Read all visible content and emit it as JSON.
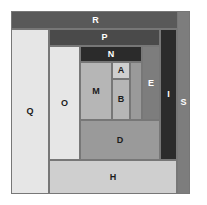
{
  "figure": {
    "canvas": {
      "width": 207,
      "height": 205
    },
    "background_color": "#ffffff",
    "frame": {
      "x": 11,
      "y": 11,
      "width": 179,
      "height": 183,
      "border_color": "#6e6e6e",
      "fill_color": "#b8b8b8"
    },
    "palette": {
      "near_black": "#2b2b2b",
      "dark_gray": "#4a4a4a",
      "medium_dark_gray": "#595959",
      "medium_gray": "#7d7d7d",
      "mid_light_gray": "#9a9a9a",
      "light_gray": "#b6b6b6",
      "pale_gray": "#cfcfcf",
      "near_white": "#e6e6e6",
      "outline": "#777777",
      "label_dark": "#1c1c1c",
      "label_light": "#ffffff"
    },
    "pieces": [
      {
        "id": "R",
        "label": "R",
        "x": 11,
        "y": 11,
        "width": 169,
        "height": 18,
        "fill": "#595959",
        "label_color": "light"
      },
      {
        "id": "Q",
        "label": "Q",
        "x": 11,
        "y": 29,
        "width": 38,
        "height": 165,
        "fill": "#e6e6e6",
        "label_color": "dark"
      },
      {
        "id": "P",
        "label": "P",
        "x": 49,
        "y": 29,
        "width": 111,
        "height": 17,
        "fill": "#4a4a4a",
        "label_color": "light"
      },
      {
        "id": "O",
        "label": "O",
        "x": 49,
        "y": 46,
        "width": 31,
        "height": 114,
        "fill": "#e6e6e6",
        "label_color": "dark"
      },
      {
        "id": "N",
        "label": "N",
        "x": 80,
        "y": 46,
        "width": 62,
        "height": 16,
        "fill": "#2b2b2b",
        "label_color": "light"
      },
      {
        "id": "E",
        "label": "E",
        "x": 142,
        "y": 46,
        "width": 18,
        "height": 74,
        "fill": "#7d7d7d",
        "label_color": "light"
      },
      {
        "id": "I",
        "label": "I",
        "x": 160,
        "y": 29,
        "width": 17,
        "height": 131,
        "fill": "#2b2b2b",
        "label_color": "light"
      },
      {
        "id": "S",
        "label": "S",
        "x": 177,
        "y": 11,
        "width": 13,
        "height": 183,
        "fill": "#7d7d7d",
        "label_color": "light"
      },
      {
        "id": "M",
        "label": "M",
        "x": 80,
        "y": 62,
        "width": 32,
        "height": 58,
        "fill": "#b6b6b6",
        "label_color": "dark"
      },
      {
        "id": "A",
        "label": "A",
        "x": 112,
        "y": 62,
        "width": 18,
        "height": 17,
        "fill": "#cfcfcf",
        "label_color": "dark"
      },
      {
        "id": "B",
        "label": "B",
        "x": 112,
        "y": 79,
        "width": 18,
        "height": 41,
        "fill": "#b6b6b6",
        "label_color": "dark"
      },
      {
        "id": "D",
        "label": "D",
        "x": 80,
        "y": 120,
        "width": 80,
        "height": 40,
        "fill": "#9a9a9a",
        "label_color": "dark"
      },
      {
        "id": "H",
        "label": "H",
        "x": 49,
        "y": 160,
        "width": 128,
        "height": 34,
        "fill": "#cfcfcf",
        "label_color": "dark"
      }
    ],
    "extra_fill": {
      "id": "N-right-gap",
      "x": 130,
      "y": 62,
      "width": 12,
      "height": 58,
      "fill": "#9a9a9a"
    }
  }
}
